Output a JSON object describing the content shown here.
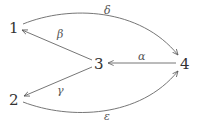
{
  "diagram": {
    "type": "directed-graph",
    "nodes": [
      {
        "id": "1",
        "label": "1",
        "x": 14,
        "y": 28
      },
      {
        "id": "2",
        "label": "2",
        "x": 14,
        "y": 100
      },
      {
        "id": "3",
        "label": "3",
        "x": 98,
        "y": 64
      },
      {
        "id": "4",
        "label": "4",
        "x": 184,
        "y": 64
      }
    ],
    "edges": [
      {
        "from": "1",
        "to": "4",
        "label": "δ",
        "shape": "curve-up"
      },
      {
        "from": "3",
        "to": "1",
        "label": "β",
        "shape": "straight"
      },
      {
        "from": "4",
        "to": "3",
        "label": "α",
        "shape": "straight"
      },
      {
        "from": "3",
        "to": "2",
        "label": "γ",
        "shape": "straight"
      },
      {
        "from": "2",
        "to": "4",
        "label": "ε",
        "shape": "curve-down"
      }
    ]
  }
}
